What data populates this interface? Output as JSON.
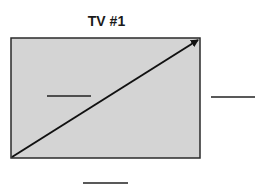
{
  "diagram": {
    "title": "TV #1",
    "screen": {
      "fill": "#d4d4d4",
      "stroke": "#2a2a2a",
      "x": 11,
      "y": 38,
      "width": 189,
      "height": 120
    },
    "diagonal_arrow": {
      "from": [
        12,
        157
      ],
      "to": [
        199,
        39
      ],
      "color": "#111111"
    },
    "blanks": [
      {
        "label": "",
        "x1": 47,
        "x2": 91,
        "y": 96
      },
      {
        "label": "",
        "x1": 211,
        "x2": 255,
        "y": 97
      },
      {
        "label": "",
        "x1": 83,
        "x2": 128,
        "y": 183
      }
    ]
  }
}
